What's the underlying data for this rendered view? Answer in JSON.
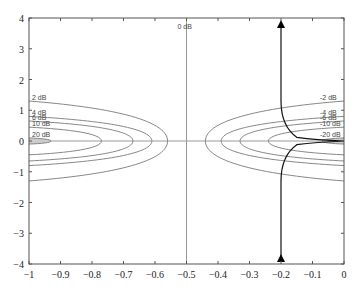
{
  "chart_data": {
    "type": "line",
    "title": "",
    "xlabel": "",
    "ylabel": "",
    "xlim": [
      -1,
      0
    ],
    "ylim": [
      -4,
      4
    ],
    "grid": false,
    "x_ticks": [
      "-1",
      "-0.9",
      "-0.8",
      "-0.7",
      "-0.6",
      "-0.5",
      "-0.4",
      "-0.3",
      "-0.2",
      "-0.1",
      "0"
    ],
    "y_ticks": [
      "-4",
      "-3",
      "-2",
      "-1",
      "0",
      "1",
      "2",
      "3",
      "4"
    ],
    "contours": [
      {
        "label": "2 dB",
        "side": "left",
        "tip_x": -0.56,
        "half_width_at_edge": 1.3
      },
      {
        "label": "4 dB",
        "side": "left",
        "tip_x": -0.61,
        "half_width_at_edge": 0.8
      },
      {
        "label": "6 dB",
        "side": "left",
        "tip_x": -0.67,
        "half_width_at_edge": 0.65
      },
      {
        "label": "10 dB",
        "side": "left",
        "tip_x": -0.77,
        "half_width_at_edge": 0.45
      },
      {
        "label": "20 dB",
        "side": "left",
        "tip_x": -0.93,
        "half_width_at_edge": 0.1
      },
      {
        "label": "0 dB",
        "side": "vertical",
        "x": -0.5
      },
      {
        "label": "-2 dB",
        "side": "right",
        "tip_x": -0.44,
        "half_width_at_edge": 1.3
      },
      {
        "label": "-4 dB",
        "side": "right",
        "tip_x": -0.39,
        "half_width_at_edge": 0.8
      },
      {
        "label": "-6 dB",
        "side": "right",
        "tip_x": -0.33,
        "half_width_at_edge": 0.65
      },
      {
        "label": "-10 dB",
        "side": "right",
        "tip_x": -0.24,
        "half_width_at_edge": 0.45
      },
      {
        "label": "-20 dB",
        "side": "right",
        "tip_x": -0.07,
        "half_width_at_edge": 0.1
      }
    ],
    "locus": {
      "description": "Dark curve with arrows at both ends, near x=-0.2, bending toward (0,0) at y=0",
      "asymptote_x": -0.2,
      "arrow_top": [
        -0.2,
        4
      ],
      "arrow_bottom": [
        -0.2,
        -4
      ]
    }
  }
}
